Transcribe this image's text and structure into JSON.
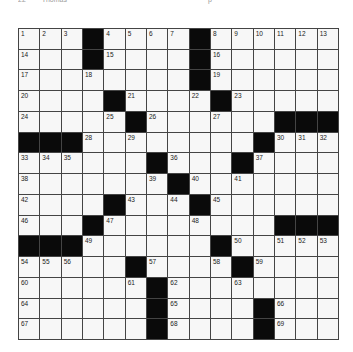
{
  "header": {
    "left": "22",
    "left2": "Thomas",
    "right": "p"
  },
  "puzzle": {
    "rows": 15,
    "cols": 15,
    "grid": [
      [
        "1",
        "2",
        "3",
        "#",
        "4",
        "5",
        "6",
        "7",
        "#",
        "8",
        "9",
        "10",
        "11",
        "12",
        "13"
      ],
      [
        "14",
        ".",
        ".",
        "#",
        "15",
        ".",
        ".",
        ".",
        "#",
        "16",
        ".",
        ".",
        ".",
        ".",
        "."
      ],
      [
        "17",
        ".",
        ".",
        "18",
        ".",
        ".",
        ".",
        ".",
        "#",
        "19",
        ".",
        ".",
        ".",
        ".",
        "."
      ],
      [
        "20",
        ".",
        ".",
        ".",
        "#",
        "21",
        ".",
        ".",
        "22",
        "#",
        "23",
        ".",
        ".",
        ".",
        "."
      ],
      [
        "24",
        ".",
        ".",
        ".",
        "25",
        "#",
        "26",
        ".",
        ".",
        "27",
        ".",
        ".",
        "#",
        "#",
        "#"
      ],
      [
        "#",
        "#",
        "#",
        "28",
        ".",
        "29",
        ".",
        ".",
        ".",
        ".",
        ".",
        "#",
        "30",
        "31",
        "32"
      ],
      [
        "33",
        "34",
        "35",
        ".",
        ".",
        ".",
        "#",
        "36",
        ".",
        ".",
        "#",
        "37",
        ".",
        ".",
        "."
      ],
      [
        "38",
        ".",
        ".",
        ".",
        ".",
        ".",
        "39",
        "#",
        "40",
        ".",
        "41",
        ".",
        ".",
        ".",
        "."
      ],
      [
        "42",
        ".",
        ".",
        ".",
        "#",
        "43",
        ".",
        "44",
        "#",
        "45",
        ".",
        ".",
        ".",
        ".",
        "."
      ],
      [
        "46",
        ".",
        ".",
        "#",
        "47",
        ".",
        ".",
        ".",
        "48",
        ".",
        ".",
        ".",
        "#",
        "#",
        "#"
      ],
      [
        "#",
        "#",
        "#",
        "49",
        ".",
        ".",
        ".",
        ".",
        ".",
        "#",
        "50",
        ".",
        "51",
        "52",
        "53"
      ],
      [
        "54",
        "55",
        "56",
        ".",
        ".",
        "#",
        "57",
        ".",
        ".",
        "58",
        "#",
        "59",
        ".",
        ".",
        "."
      ],
      [
        "60",
        ".",
        ".",
        ".",
        ".",
        "61",
        "#",
        "62",
        ".",
        ".",
        "63",
        ".",
        ".",
        ".",
        "."
      ],
      [
        "64",
        ".",
        ".",
        ".",
        ".",
        ".",
        "#",
        "65",
        ".",
        ".",
        ".",
        "#",
        "66",
        ".",
        "."
      ],
      [
        "67",
        ".",
        ".",
        ".",
        ".",
        ".",
        "#",
        "68",
        ".",
        ".",
        ".",
        "#",
        "69",
        ".",
        "."
      ]
    ]
  }
}
